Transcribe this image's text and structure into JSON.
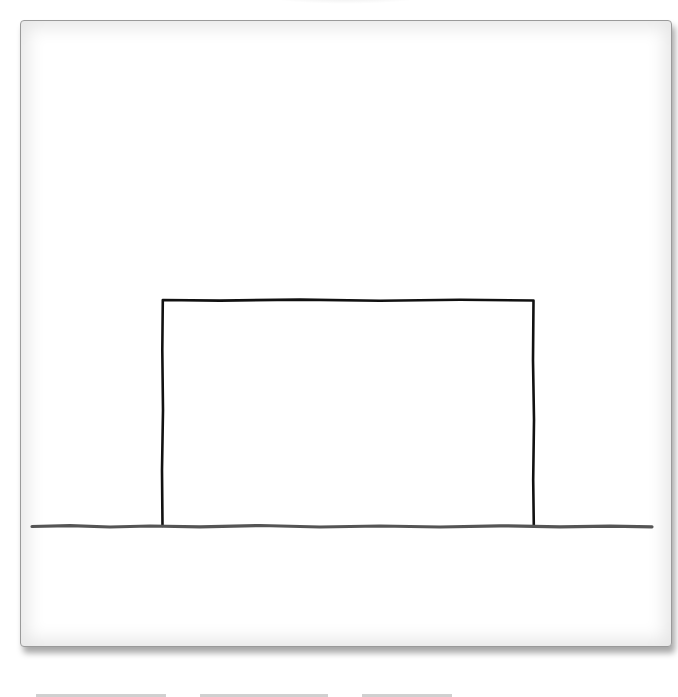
{
  "diagram": {
    "type": "sketch",
    "colors": {
      "background": "#ffffff",
      "frame_border": "#9a9a9a",
      "rectangle_stroke": "#111111",
      "ground_line": "#555555"
    },
    "shapes": [
      {
        "kind": "rectangle",
        "x": 162,
        "y": 300,
        "width": 372,
        "height": 226
      },
      {
        "kind": "line",
        "x1": 32,
        "y1": 526,
        "x2": 652,
        "y2": 526
      }
    ]
  }
}
